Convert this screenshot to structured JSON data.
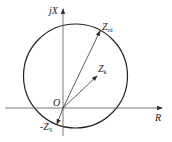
{
  "diagram": {
    "type": "impedance-circle-diagram",
    "axes": {
      "vertical_label": "jX",
      "horizontal_label": "R",
      "origin_label": "O"
    },
    "vectors": [
      {
        "name": "Z_rd",
        "label_main": "Z",
        "label_sub": "rd"
      },
      {
        "name": "Z_k",
        "label_main": "Z",
        "label_sub": "k"
      },
      {
        "name": "-Z_S",
        "label_main": "-Z",
        "label_sub": "S"
      }
    ],
    "colors": {
      "line": "#333333",
      "circle": "#222222",
      "background": "#ffffff"
    }
  }
}
